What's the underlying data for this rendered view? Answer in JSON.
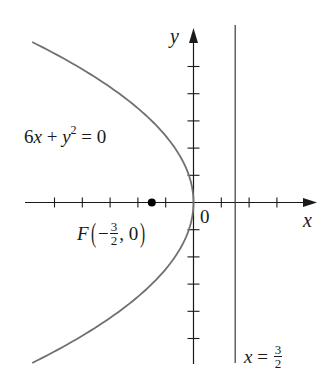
{
  "figure": {
    "equation_label": {
      "coef": "6",
      "x": "x",
      "plus": " + ",
      "y": "y",
      "exp": "2",
      "rhs": " = 0"
    },
    "focus_label": {
      "name": "F",
      "minus": "−",
      "num": "3",
      "den": "2",
      "rest": ", 0"
    },
    "directrix_label": {
      "var": "x",
      "eq": " = ",
      "num": "3",
      "den": "2"
    },
    "origin_label": "0",
    "x_axis_label": "x",
    "y_axis_label": "y",
    "colors": {
      "axis": "#1a1a1a",
      "curve": "#707070",
      "directrix": "#3a3a3a",
      "focus": "#000000"
    }
  },
  "chart_data": {
    "type": "line",
    "title": "",
    "equation": "6x + y^2 = 0",
    "series": [
      {
        "name": "parabola 6x + y^2 = 0",
        "kind": "curve",
        "param": "x = -y^2/6",
        "y_range": [
          -5.9,
          5.9
        ]
      },
      {
        "name": "directrix x = 3/2",
        "kind": "vertical_line",
        "x": 1.5
      }
    ],
    "points": [
      {
        "label": "F(-3/2, 0)",
        "x": -1.5,
        "y": 0
      }
    ],
    "xlabel": "x",
    "ylabel": "y",
    "xlim": [
      -5.3,
      3.2
    ],
    "ylim": [
      -5.9,
      6.4
    ],
    "x_ticks": [
      -5,
      -4,
      -3,
      -2,
      -1,
      1,
      2,
      3
    ],
    "y_ticks": [
      -5,
      -4,
      -3,
      -2,
      -1,
      1,
      2,
      3,
      4,
      5
    ],
    "grid": false
  }
}
